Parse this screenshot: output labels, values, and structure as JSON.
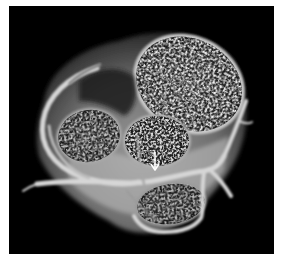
{
  "figure": {
    "description": "3D volume-rendered cardiac CT of the heart base showing valves and coronary arteries",
    "background_color": "#000000",
    "border_color": "#ffffff",
    "annotation": {
      "type": "arrow",
      "direction": "down",
      "color": "#ffffff",
      "label": ""
    },
    "structures": [
      {
        "name": "pulmonary-valve",
        "position": "upper-right",
        "texture": "speckled"
      },
      {
        "name": "aortic-valve",
        "position": "center",
        "texture": "speckled"
      },
      {
        "name": "left-atrial-region",
        "position": "left",
        "texture": "speckled"
      },
      {
        "name": "lower-valve",
        "position": "lower-center",
        "texture": "speckled"
      },
      {
        "name": "coronary-arteries",
        "position": "encircling",
        "texture": "smooth-tube"
      }
    ]
  }
}
